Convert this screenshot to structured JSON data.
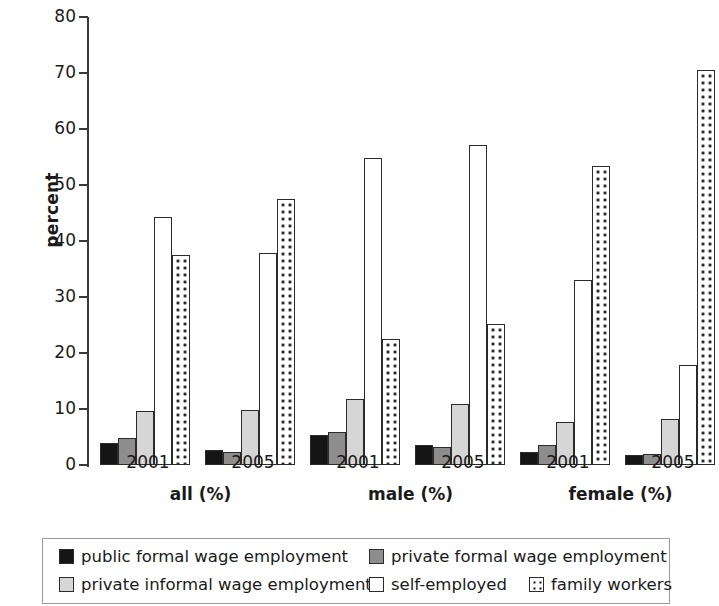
{
  "chart_data": {
    "type": "bar",
    "title": "",
    "subtitle": "",
    "xlabel": "",
    "ylabel": "percent",
    "ylim": [
      0,
      80
    ],
    "ytick_labels": [
      "0",
      "10",
      "20",
      "30",
      "40",
      "50",
      "60",
      "70",
      "80"
    ],
    "ytick_values": [
      0,
      10,
      20,
      30,
      40,
      50,
      60,
      70,
      80
    ],
    "grid": false,
    "legend_position": "bottom",
    "group_labels": [
      "all (%)",
      "male (%)",
      "female (%)"
    ],
    "categories": [
      "all (%) 2001",
      "all (%) 2005",
      "male (%) 2001",
      "male (%) 2005",
      "female (%) 2001",
      "female (%) 2005"
    ],
    "category_years": [
      "2001",
      "2005",
      "2001",
      "2005",
      "2001",
      "2005"
    ],
    "series": [
      {
        "name": "public formal wage employment",
        "key": "s0",
        "color": "#151515",
        "pattern": "solid-black",
        "values": [
          4.0,
          2.6,
          5.4,
          3.5,
          2.3,
          1.7
        ]
      },
      {
        "name": "private formal wage employment",
        "key": "s1",
        "color": "#8d8d8d",
        "pattern": "solid-grey",
        "values": [
          4.9,
          2.3,
          5.9,
          3.2,
          3.6,
          1.9
        ]
      },
      {
        "name": "private informal wage employment",
        "key": "s2",
        "color": "#d6d6d6",
        "pattern": "solid-light-grey",
        "values": [
          9.7,
          9.8,
          11.7,
          10.9,
          7.6,
          8.2
        ]
      },
      {
        "name": "self-employed",
        "key": "s3",
        "color": "#ffffff",
        "pattern": "open-white",
        "values": [
          44.3,
          37.9,
          54.9,
          57.2,
          33.1,
          17.9
        ]
      },
      {
        "name": "family workers",
        "key": "s4",
        "color": "#ffffff",
        "pattern": "dotted",
        "values": [
          37.5,
          47.5,
          22.5,
          25.1,
          53.4,
          70.5
        ]
      }
    ]
  },
  "legend": {
    "items": [
      {
        "label": "public formal wage employment",
        "key": "s0"
      },
      {
        "label": "private formal wage employment",
        "key": "s1"
      },
      {
        "label": "private informal wage employment",
        "key": "s2"
      },
      {
        "label": "self-employed",
        "key": "s3"
      },
      {
        "label": "family workers",
        "key": "s4"
      }
    ]
  }
}
